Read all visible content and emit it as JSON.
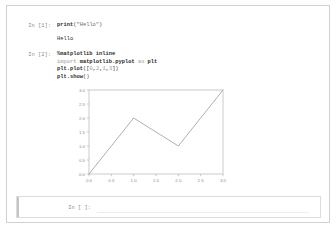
{
  "notebook": {
    "cells": [
      {
        "type": "code",
        "prompt": "In [1]:",
        "source_lines": [
          {
            "segments": [
              {
                "text": "print",
                "tok": "fn"
              },
              {
                "text": "(",
                "tok": "punct"
              },
              {
                "text": "\"Hello\"",
                "tok": "str"
              },
              {
                "text": ")",
                "tok": "punct"
              }
            ]
          }
        ],
        "output": {
          "type": "stream",
          "text": "Hello"
        }
      },
      {
        "type": "code",
        "prompt": "In [2]:",
        "source_lines": [
          {
            "segments": [
              {
                "text": "%matplotlib inline",
                "tok": "magic"
              }
            ]
          },
          {
            "segments": [
              {
                "text": "import ",
                "tok": "kw"
              },
              {
                "text": "matplotlib.pyplot",
                "tok": "mod"
              },
              {
                "text": " as ",
                "tok": "kw"
              },
              {
                "text": "plt",
                "tok": "mod"
              }
            ]
          },
          {
            "segments": [
              {
                "text": "plt.plot",
                "tok": "fn"
              },
              {
                "text": "([",
                "tok": "punct"
              },
              {
                "text": "0",
                "tok": "num"
              },
              {
                "text": ",",
                "tok": "punct"
              },
              {
                "text": "2",
                "tok": "num"
              },
              {
                "text": ",",
                "tok": "punct"
              },
              {
                "text": "1",
                "tok": "num"
              },
              {
                "text": ",",
                "tok": "punct"
              },
              {
                "text": "3",
                "tok": "num"
              },
              {
                "text": "])",
                "tok": "punct"
              }
            ]
          },
          {
            "segments": [
              {
                "text": "plt.show",
                "tok": "fn"
              },
              {
                "text": "()",
                "tok": "punct"
              }
            ]
          }
        ],
        "output": {
          "type": "figure"
        }
      },
      {
        "type": "code",
        "prompt": "In [ ]:",
        "source_lines": [],
        "selected": true
      }
    ]
  },
  "chart_data": {
    "type": "line",
    "title": "",
    "xlabel": "",
    "ylabel": "",
    "x": [
      0,
      1,
      2,
      3
    ],
    "values": [
      0,
      2,
      1,
      3
    ],
    "series": [
      {
        "name": "",
        "values": [
          0,
          2,
          1,
          3
        ]
      }
    ],
    "xlim": [
      0,
      3
    ],
    "ylim": [
      0,
      3
    ],
    "xticks": [
      "0.0",
      "0.5",
      "1.0",
      "1.5",
      "2.0",
      "2.5",
      "3.0"
    ],
    "xtick_values": [
      0,
      0.5,
      1.0,
      1.5,
      2.0,
      2.5,
      3.0
    ],
    "yticks": [
      "0.0",
      "0.5",
      "1.0",
      "1.5",
      "2.0",
      "2.5",
      "3.0"
    ],
    "ytick_values": [
      0,
      0.5,
      1.0,
      1.5,
      2.0,
      2.5,
      3.0
    ],
    "grid": false,
    "legend": null,
    "line_color": "#9a9a9a",
    "axes_color": "#b4b4b4",
    "tick_label_color": "#8c8c8c"
  },
  "colors": {
    "page_background": "#ffffff",
    "frame_border": "#d0d0d0",
    "prompt_text": "#8a8a8a",
    "code_text": "#3b3b3b",
    "selected_cell_accent": "#c4c4c4"
  }
}
